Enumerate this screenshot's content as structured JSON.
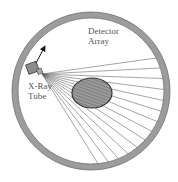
{
  "diagram": {
    "labels": {
      "detector": [
        "Detector",
        "Array"
      ],
      "tube": [
        "X-Ray",
        "Tube"
      ]
    },
    "components": {
      "detector_ring": {
        "cx": 91,
        "cy": 91,
        "r_outer": 79,
        "r_inner": 73,
        "fill": "#9a9a9a",
        "stroke": "#666666"
      },
      "xray_tube": {
        "x": 28,
        "y": 64,
        "w": 10,
        "h": 9,
        "fill": "#8a8a8a"
      },
      "patient_object": {
        "cx": 92,
        "cy": 93,
        "rx": 20,
        "ry": 15,
        "fill": "#888888",
        "stroke": "#333333"
      },
      "rotation_arrow": {
        "from": [
          36,
          63
        ],
        "to": [
          45,
          47
        ]
      },
      "beam_source": [
        42,
        74
      ],
      "ray_count": 14
    },
    "colors": {
      "ring": "#9a9a9a",
      "ray": "#555555",
      "text": "#555555",
      "object": "#888888"
    }
  }
}
